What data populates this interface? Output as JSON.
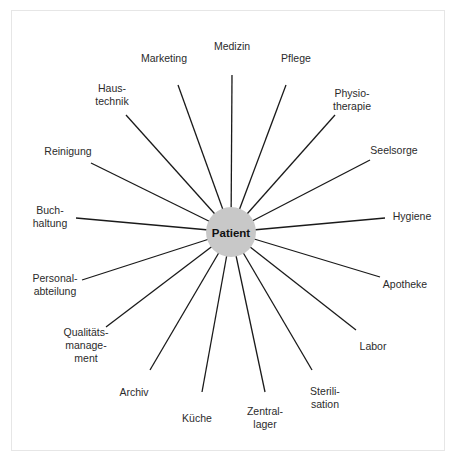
{
  "diagram": {
    "type": "hub-and-spoke",
    "center": {
      "label": "Patient",
      "x": 231,
      "y": 232,
      "r": 25,
      "fill": "#c8c8c8"
    },
    "nodes": [
      {
        "id": "medizin",
        "lines": [
          "Medizin"
        ],
        "lx": 232,
        "ly": 46,
        "ex": 232,
        "ey": 75
      },
      {
        "id": "pflege",
        "lines": [
          "Pflege"
        ],
        "lx": 296,
        "ly": 58,
        "ex": 286,
        "ey": 85
      },
      {
        "id": "physiotherapie",
        "lines": [
          "Physio-",
          "therapie"
        ],
        "lx": 352,
        "ly": 100,
        "ex": 335,
        "ey": 115
      },
      {
        "id": "seelsorge",
        "lines": [
          "Seelsorge"
        ],
        "lx": 394,
        "ly": 150,
        "ex": 370,
        "ey": 160
      },
      {
        "id": "hygiene",
        "lines": [
          "Hygiene"
        ],
        "lx": 412,
        "ly": 216,
        "ex": 385,
        "ey": 218
      },
      {
        "id": "apotheke",
        "lines": [
          "Apotheke"
        ],
        "lx": 405,
        "ly": 284,
        "ex": 380,
        "ey": 277
      },
      {
        "id": "labor",
        "lines": [
          "Labor"
        ],
        "lx": 373,
        "ly": 346,
        "ex": 356,
        "ey": 330
      },
      {
        "id": "sterilisation",
        "lines": [
          "Sterili-",
          "sation"
        ],
        "lx": 325,
        "ly": 398,
        "ex": 312,
        "ey": 370
      },
      {
        "id": "zentrallager",
        "lines": [
          "Zentral-",
          "lager"
        ],
        "lx": 265,
        "ly": 418,
        "ex": 265,
        "ey": 392
      },
      {
        "id": "kueche",
        "lines": [
          "Küche"
        ],
        "lx": 197,
        "ly": 418,
        "ex": 202,
        "ey": 392
      },
      {
        "id": "archiv",
        "lines": [
          "Archiv"
        ],
        "lx": 134,
        "ly": 392,
        "ex": 150,
        "ey": 370
      },
      {
        "id": "qualitaetsmanagement",
        "lines": [
          "Qualitäts-",
          "manage-",
          "ment"
        ],
        "lx": 86,
        "ly": 345,
        "ex": 106,
        "ey": 327
      },
      {
        "id": "personalabteilung",
        "lines": [
          "Personal-",
          "abteilung"
        ],
        "lx": 55,
        "ly": 285,
        "ex": 82,
        "ey": 280
      },
      {
        "id": "buchhaltung",
        "lines": [
          "Buch-",
          "haltung"
        ],
        "lx": 50,
        "ly": 217,
        "ex": 76,
        "ey": 218
      },
      {
        "id": "reinigung",
        "lines": [
          "Reinigung"
        ],
        "lx": 68,
        "ly": 151,
        "ex": 91,
        "ey": 163
      },
      {
        "id": "haustechnik",
        "lines": [
          "Haus-",
          "technik"
        ],
        "lx": 112,
        "ly": 95,
        "ex": 126,
        "ey": 115
      },
      {
        "id": "marketing",
        "lines": [
          "Marketing"
        ],
        "lx": 164,
        "ly": 58,
        "ex": 178,
        "ey": 85
      }
    ]
  }
}
